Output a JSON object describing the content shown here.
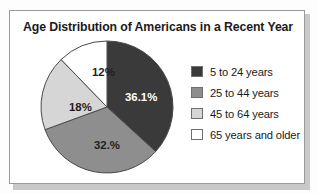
{
  "panel": {
    "title": "Age Distribution of Americans in a Recent Year"
  },
  "colors": {
    "slice_5_to_24": "#3a3a3a",
    "slice_25_to_44": "#8e8e8e",
    "slice_45_to_64": "#d6d6d6",
    "slice_65_plus": "#ffffff",
    "outline": "#4a4a4a",
    "frame": "#9a9a9a",
    "text": "#1b1b1b"
  },
  "chart_data": {
    "type": "pie",
    "title": "Age Distribution of Americans in a Recent Year",
    "xlabel": "",
    "ylabel": "",
    "grid": false,
    "legend_position": "right",
    "start_angle_deg": 0,
    "direction": "clockwise",
    "categories": [
      "5 to 24 years",
      "25 to 44 years",
      "45 to 64 years",
      "65 years and older"
    ],
    "values": [
      36.1,
      32.0,
      18.0,
      12.0
    ],
    "slices": [
      {
        "label": "5 to 24 years",
        "value": 36.1,
        "data_label": "36.1%",
        "color": "#3a3a3a",
        "label_color": "on-dark",
        "label_x": 86,
        "label_y": 62
      },
      {
        "label": "25 to 44 years",
        "value": 32.0,
        "data_label": "32.%",
        "color": "#8e8e8e",
        "label_color": "on-light",
        "label_x": 55,
        "label_y": 110
      },
      {
        "label": "45 to 64 years",
        "value": 18.0,
        "data_label": "18%",
        "color": "#d6d6d6",
        "label_color": "on-light",
        "label_x": 30,
        "label_y": 72
      },
      {
        "label": "65 years and older",
        "value": 12.0,
        "data_label": "12%",
        "color": "#ffffff",
        "label_color": "on-light",
        "label_x": 53,
        "label_y": 37
      }
    ]
  },
  "legend": {
    "items": [
      {
        "label": "5 to 24 years",
        "color": "#3a3a3a"
      },
      {
        "label": "25 to 44 years",
        "color": "#8e8e8e"
      },
      {
        "label": "45 to 64 years",
        "color": "#d6d6d6"
      },
      {
        "label": "65 years and older",
        "color": "#ffffff"
      }
    ]
  }
}
